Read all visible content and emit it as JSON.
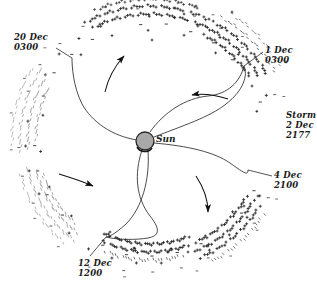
{
  "figure": {
    "background_color": "#ffffff",
    "line_color": "#1a1a1a",
    "sun": {
      "label": "Sun",
      "fill_color": "#a8a8a8",
      "stroke_color": "#262626",
      "cx": 145,
      "cy": 141,
      "r": 9
    },
    "annotations": [
      {
        "name": "annotation-20-dec",
        "date": "20 Dec",
        "time": "0300",
        "x": 14,
        "y": 32,
        "leader": "M 56 48 L 72 58"
      },
      {
        "name": "annotation-1-dec",
        "date": "1 Dec",
        "time": "0300",
        "x": 265,
        "y": 45,
        "leader": "M 263 52 L 244 66"
      },
      {
        "name": "annotation-storm",
        "date": "Storm",
        "date2": "2 Dec",
        "time": "2177",
        "x": 286,
        "y": 110,
        "leader": ""
      },
      {
        "name": "annotation-4-dec",
        "date": "4 Dec",
        "time": "2100",
        "x": 274,
        "y": 170,
        "leader": "M 272 176 L 248 170"
      },
      {
        "name": "annotation-12-dec",
        "date": "12 Dec",
        "time": "1200",
        "x": 78,
        "y": 258,
        "leader": "M 90 256 L 106 237"
      }
    ],
    "flow_arrows": [
      {
        "name": "flow-arrow-upper-left",
        "direction": "up-right"
      },
      {
        "name": "flow-arrow-upper-right",
        "direction": "left"
      },
      {
        "name": "flow-arrow-lower-left",
        "direction": "right"
      },
      {
        "name": "flow-arrow-lower-right",
        "direction": "down"
      }
    ],
    "spiral_arms": 4,
    "marker_bands": [
      {
        "name": "marker-band-top",
        "glyph": "plus",
        "color": "#1a1a1a"
      },
      {
        "name": "marker-band-upper-right",
        "glyph": "plus",
        "color": "#1a1a1a"
      },
      {
        "name": "marker-band-right",
        "glyph": "dash",
        "color": "#333333"
      },
      {
        "name": "marker-band-bottom",
        "glyph": "plus",
        "color": "#1a1a1a"
      },
      {
        "name": "marker-band-left",
        "glyph": "dash",
        "color": "#9a9a9a"
      }
    ]
  }
}
